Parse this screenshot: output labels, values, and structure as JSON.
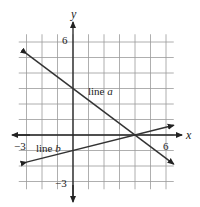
{
  "diagram": {
    "type": "coordinate-plane",
    "x_axis_label": "x",
    "y_axis_label": "y",
    "x_tick_labels": {
      "neg": "−3",
      "pos": "6"
    },
    "y_tick_labels": {
      "pos": "6",
      "neg": "−3"
    },
    "x_range": [
      -3.5,
      6.5
    ],
    "y_range": [
      -3.5,
      6.5
    ],
    "grid_step": 1,
    "lines": [
      {
        "name": "line a",
        "label_prefix": "line ",
        "label_var": "a",
        "points": [
          [
            -3,
            5.25
          ],
          [
            6.5,
            -1.875
          ]
        ],
        "y_intercept": 3,
        "x_intercept": 4
      },
      {
        "name": "line b",
        "label_prefix": "line ",
        "label_var": "b",
        "points": [
          [
            -3,
            -1.75
          ],
          [
            6.5,
            0.625
          ]
        ],
        "y_intercept": -1,
        "x_intercept": 4
      }
    ],
    "colors": {
      "grid": "#9a9a9a",
      "axis": "#222222",
      "line": "#333333"
    }
  }
}
